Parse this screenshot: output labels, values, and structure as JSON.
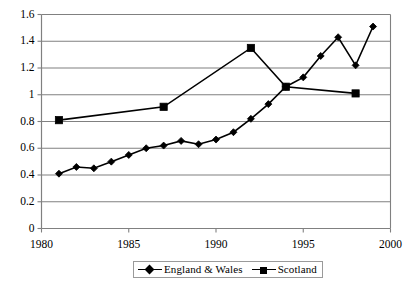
{
  "chart_data": {
    "type": "line",
    "title": "",
    "subtitle": "",
    "xlabel": "",
    "ylabel": "",
    "xlim": [
      1980,
      2000
    ],
    "ylim": [
      0,
      1.6
    ],
    "grid": true,
    "grid_axis": "y",
    "legend_position": "bottom-center",
    "x_ticks": [
      1980,
      1985,
      1990,
      1995,
      2000
    ],
    "x_tick_labels": [
      "1980",
      "1985",
      "1990",
      "1995",
      "2000"
    ],
    "y_ticks": [
      0,
      0.2,
      0.4,
      0.6,
      0.8,
      1,
      1.2,
      1.4,
      1.6
    ],
    "y_tick_labels": [
      "0",
      "0.2",
      "0.4",
      "0.6",
      "0.8",
      "1",
      "1.2",
      "1.4",
      "1.6"
    ],
    "series": [
      {
        "name": "England & Wales",
        "marker": "diamond",
        "color": "#000000",
        "x": [
          1981,
          1982,
          1983,
          1984,
          1985,
          1986,
          1987,
          1988,
          1989,
          1990,
          1991,
          1992,
          1993,
          1994,
          1995,
          1996,
          1997,
          1998,
          1999
        ],
        "values": [
          0.41,
          0.46,
          0.45,
          0.5,
          0.55,
          0.6,
          0.62,
          0.655,
          0.63,
          0.665,
          0.72,
          0.82,
          0.93,
          1.06,
          1.13,
          1.29,
          1.43,
          1.22,
          1.51
        ]
      },
      {
        "name": "Scotland",
        "marker": "square",
        "color": "#000000",
        "x": [
          1981,
          1987,
          1992,
          1994,
          1998
        ],
        "values": [
          0.81,
          0.91,
          1.35,
          1.06,
          1.01
        ]
      }
    ]
  },
  "legend": {
    "items": [
      {
        "label": "England & Wales",
        "marker": "diamond"
      },
      {
        "label": "Scotland",
        "marker": "square"
      }
    ]
  },
  "axes": {
    "y_labels": [
      "1.6",
      "1.4",
      "1.2",
      "1",
      "0.8",
      "0.6",
      "0.4",
      "0.2",
      "0"
    ],
    "x_labels": [
      "1980",
      "1985",
      "1990",
      "1995",
      "2000"
    ]
  },
  "colors": {
    "series_line": "#000000",
    "gridline": "#808080",
    "axis": "#808080",
    "background": "#ffffff"
  }
}
